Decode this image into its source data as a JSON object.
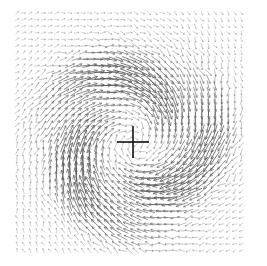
{
  "chart_data": {
    "type": "quiver",
    "title": "",
    "xlabel": "",
    "ylabel": "",
    "grid": false,
    "legend": null,
    "field_bounds_px": {
      "x0": 17,
      "y0": 13,
      "x1": 246,
      "y1": 251
    },
    "grid_spacing_px": 6.6,
    "center_px": {
      "x": 133,
      "y": 142
    },
    "vortex": {
      "rotation": "clockwise",
      "ring_radius_px": 62,
      "ring_width_px": 38,
      "max_arrow_len_px": 16,
      "background_arrow_len_px": 4.5,
      "spiral_inflow_deg": 22,
      "arm_count": 3
    },
    "center_marker": {
      "shape": "cross",
      "arm_px": 16,
      "stroke_px": 1.6
    },
    "colors": {
      "arrow": "#555555",
      "marker": "#111111",
      "background": "#ffffff"
    }
  }
}
